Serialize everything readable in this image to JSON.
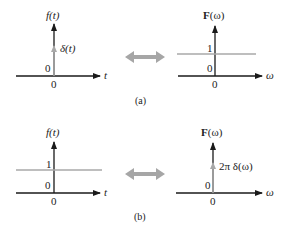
{
  "colors": {
    "axis": "#1a1a1a",
    "signal": "#a8a8a8",
    "arrow": "#a6a6a6"
  },
  "panels": [
    {
      "caption": "(a)",
      "time": {
        "ylabel": "f(t)",
        "xlabel": "t",
        "origin_y_label": "0",
        "origin_x_label": "0",
        "signal_label": "δ(t)",
        "signal": "impulse"
      },
      "freq": {
        "ylabel_bold": "F",
        "ylabel_arg": "(ω)",
        "xlabel": "ω",
        "origin_y_label": "0",
        "origin_x_label": "0",
        "level_label": "1",
        "signal": "constant"
      }
    },
    {
      "caption": "(b)",
      "time": {
        "ylabel": "f(t)",
        "xlabel": "t",
        "origin_y_label": "0",
        "origin_x_label": "0",
        "level_label": "1",
        "signal": "constant"
      },
      "freq": {
        "ylabel_bold": "F",
        "ylabel_arg": "(ω)",
        "xlabel": "ω",
        "origin_y_label": "0",
        "origin_x_label": "0",
        "signal_label": "2π δ(ω)",
        "signal": "impulse"
      }
    }
  ]
}
